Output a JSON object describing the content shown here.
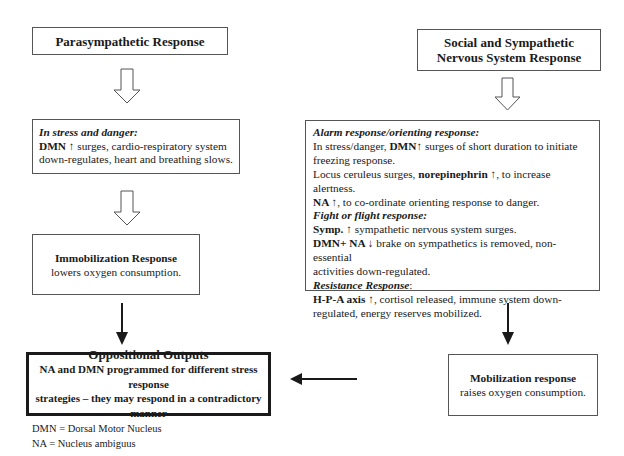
{
  "left_column": {
    "parasympathetic_title": "Parasympathetic Response",
    "stress_box": {
      "heading": "In stress and danger:",
      "dmn_label": "DMN",
      "up_arrow": "↑",
      "line1_rest": " surges, cardio-respiratory system",
      "line2": "down-regulates, heart and breathing slows."
    },
    "immobilization": {
      "title": "Immobilization Response",
      "text": "lowers oxygen consumption."
    }
  },
  "right_column": {
    "social_title_line1": "Social and Sympathetic",
    "social_title_line2": "Nervous System Response",
    "alarm_box": {
      "alarm_heading": "Alarm response/orienting response:",
      "alarm_l1_pre": "In stress/danger, ",
      "alarm_l1_bold": "DMN",
      "alarm_l1_arrow": "↑",
      "alarm_l1_post": " surges of short duration to initiate",
      "alarm_l2": "freezing response.",
      "alarm_l3_pre": "Locus ceruleus surges, ",
      "alarm_l3_bold": "norepinephrin",
      "alarm_l3_arrow": " ↑",
      "alarm_l3_post": ", to increase alertness.",
      "alarm_l4_bold": "NA",
      "alarm_l4_arrow": " ↑",
      "alarm_l4_post": ", to co-ordinate orienting response to danger.",
      "fight_heading": "Fight or flight response:",
      "fight_l1_bold": "Symp.",
      "fight_l1_arrow": " ↑",
      "fight_l1_post": " sympathetic nervous system surges.",
      "fight_l2_bold": "DMN+ NA",
      "fight_l2_arrow": " ↓",
      "fight_l2_post": " brake on sympathetics is removed, non-essential",
      "fight_l3": "activities down-regulated.",
      "resistance_heading": "Resistance Response",
      "resistance_colon": ":",
      "res_l1_bold": "H-P-A axis",
      "res_l1_arrow": " ↑",
      "res_l1_post": ", cortisol released, immune system down-",
      "res_l2": "regulated, energy reserves mobilized."
    },
    "mobilization": {
      "title": "Mobilization response",
      "text": "raises oxygen consumption."
    }
  },
  "outputs": {
    "title": "Oppositional Outputs",
    "line1": "NA and DMN programmed for different stress response",
    "line2": "strategies – they may respond in a contradictory manner"
  },
  "footnotes": {
    "dmn": "DMN = Dorsal Motor Nucleus",
    "na": "NA = Nucleus ambiguus"
  },
  "colors": {
    "border": "#555555",
    "arrow": "#1a1a1a",
    "text": "#1a1a1a"
  }
}
